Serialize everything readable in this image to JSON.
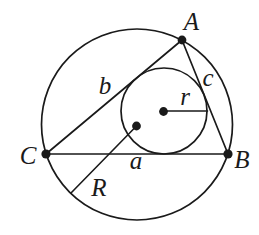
{
  "figure": {
    "background_color": "#ffffff",
    "line_color": "#1a1a1a",
    "labels": {
      "vertex_a": "A",
      "vertex_b": "B",
      "vertex_c": "C",
      "side_a": "a",
      "side_b": "b",
      "side_c": "c",
      "inradius": "r",
      "circumradius": "R"
    }
  }
}
